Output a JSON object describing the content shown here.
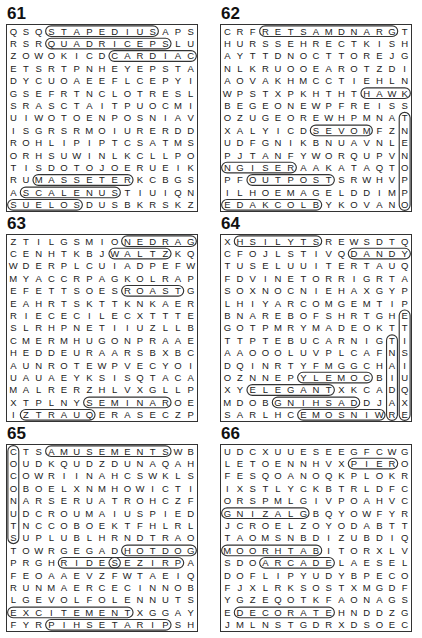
{
  "puzzles": [
    {
      "number": "61",
      "rows": [
        "QSQSTAPEDIUSAPS",
        "RSRQUADRICEPSLU",
        "ZOWOKICDCARDIAC",
        "ETSRTPNHEYEPSTA",
        "DYCUOAEEFLCEPYI",
        "GSEFRTNCLOTRESL",
        "SRASCTAITPUOCMI",
        "UIWOTOENPOSNIAV",
        "ISGRSRMOIURERDD",
        "ROHLIPIPTCSATMS",
        "ORHSUWINLKCLLPO",
        "TISDOTOJOERUEIK",
        "RUMASSETERKCBGS",
        "ASCALENUSTIUIQN",
        "SUELOSDUSBKRSKZ"
      ],
      "found_words": [
        "STAPEDIUS",
        "QUADRICEPS",
        "CARDIAC",
        "MASSETER",
        "SCALENUS",
        "SOLEUS"
      ]
    },
    {
      "number": "62",
      "rows": [
        "CRFRETSAMDNARGT",
        "HURSSEHRECTKISH",
        "AYTTDNOCTTOREJG",
        "NLKRUOOEAROTZDI",
        "AOVAKHMCCTIEHLN",
        "WPSTXPKHTHTHAWK",
        "BEGEONEWPFREISS",
        "OZUGEOREWHPMNAT",
        "XALYICDSEVOMFZN",
        "UDFGNIKBNUAVNLE",
        "PJTANFYWORQUPVN",
        "NGISERAAKATAQTO",
        "PFOUTPOSTSRWHVP",
        "ILHOEMAGELDDIMP",
        "EDAKCOLBYKOVANO"
      ],
      "found_words": [
        "GRANDMASTER",
        "MOVES",
        "RESIGN",
        "OUTPOST",
        "ENDGAME",
        "BLOCKADE",
        "OPPONENT",
        "HAWK"
      ]
    },
    {
      "number": "63",
      "rows": [
        "ZTILGSMIONEDRAG",
        "CENHTKBJWALTZKQ",
        "WDERPLCUIADPEFW",
        "MYACCRPAGKOLRAP",
        "EFETTSOESROASTG",
        "EAHRTSKTTKNKAER",
        "RIECECILECXTTTE",
        "SLRHPNETIIUZLLB",
        "CMERMHUGONPRAAE",
        "HEDDEURAARSBXBC",
        "AUNROTEWPVECYOI",
        "UAUAEYKSISQTACA",
        "MALRERZHLVXGLLP",
        "XTPLNYSEMINAROE",
        "IZTRAUQERASECZP"
      ],
      "found_words": [
        "GARDEN",
        "WALTZ",
        "ROAST",
        "SEMINAR",
        "QUARTZ"
      ]
    },
    {
      "number": "64",
      "rows": [
        "XHSILYTSREWSDTQ",
        "CFOJLSTIVQDANDY",
        "TUSELUUITERTAUQ",
        "FDVINETORRIGRTA",
        "SOXNOCNIEHAXGYP",
        "LHIYARCOMGEMTIP",
        "BNAREBOFSHRTGHE",
        "GOTPMRYMADEOKTT",
        "TTPTEBUCARNIGTI",
        "AAOOOLUVPLCAFNS",
        "DQINRTYFMGGCHAI",
        "OZNNEPYLEMOCBIU",
        "XYELEGANTXKCADQ",
        "MDOBGNIHSADDJAX",
        "SARLHCEMOSNIWRE"
      ],
      "found_words": [
        "STYLISH",
        "DANDY",
        "ELEGANT",
        "COMELY",
        "DASHING",
        "WINSOME",
        "EXQUISITE",
        "RADIANT"
      ]
    },
    {
      "number": "65",
      "rows": [
        "CTSAMUSEMENTSWB",
        "OUDKQUDZDUNAQAH",
        "COWRIINAHCSWKLS",
        "OBOELXNMHOWICTI",
        "NARSERUATROHCZF",
        "UDCROUMAIUSPIED",
        "TNCCOBOEKTFHLRL",
        "SUPLUBLHRNDTRAO",
        "TOWRGEGADHOTDOG",
        "PRGHRIDESEZIRPA",
        "FEOAAEVZFWTAEIQ",
        "RUNMAERCECINNOB",
        "LGEVOLFOLENNUTS",
        "EXCITEMENTXGGAY",
        "FYRPIHSETARIPSH"
      ],
      "found_words": [
        "AMUSEMENTS",
        "HOTDOG",
        "RIDES",
        "PRIZES",
        "FUNNEL",
        "EXCITEMENT",
        "PIRATESHIP",
        "COCONUTS"
      ]
    },
    {
      "number": "66",
      "rows": [
        "UDCXUUESEEGFCWG",
        "LETOENNHVXPIERO",
        "FESQOANOQKPLOKR",
        "IXSTLYCKBTRLDFC",
        "ORSPMLGIVPOAHVC",
        "GNIZALGBQYOWFYR",
        "JCROELZOYODABTT",
        "TAOMSNBDIZUBDIQ",
        "MOORHTABITORXLV",
        "SDOARCADELAESEL",
        "DOFLIPYUDYBPECO",
        "FJXLRKSOSTXMGDF",
        "YGZEQOTKFAONAGS",
        "EDECORATEHNDDZG",
        "JMLNSTGDRXDSOEC"
      ],
      "found_words": [
        "PIER",
        "GLAZING",
        "ARCADE",
        "DECORATE",
        "BATHROOM",
        "WOOD"
      ]
    }
  ]
}
